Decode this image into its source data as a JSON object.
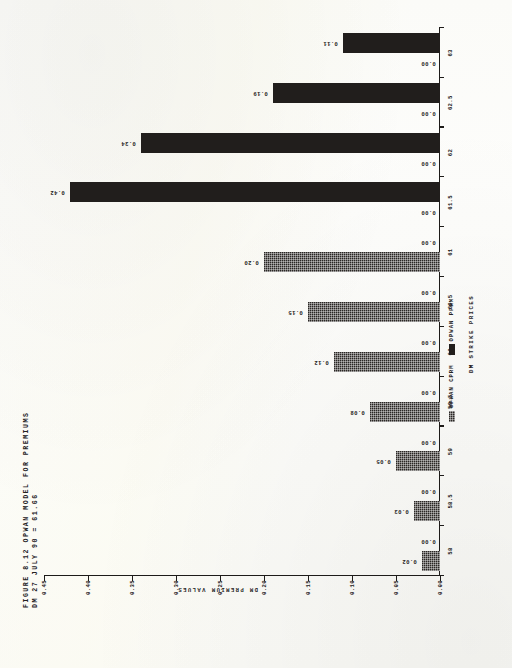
{
  "figure": {
    "title_line1": "FIGURE 8.12  OPWAN MODEL FOR PREMIUMS",
    "title_line2": "DM 27 JULY 90 = 61.66",
    "ylabel": "DM PREMIUM VALUES",
    "xlabel": "DM STRIKE PRICES"
  },
  "legend": {
    "cprm_label": "OPWAN CPRM",
    "pfrm_label": "OPWAN PFRM"
  },
  "chart_data": {
    "type": "bar",
    "title": "FIGURE 8.12  OPWAN MODEL FOR PREMIUMS  DM 27 JULY 90 = 61.66",
    "xlabel": "DM STRIKE PRICES",
    "ylabel": "DM PREMIUM VALUES",
    "categories": [
      "58",
      "58.5",
      "59",
      "59.5",
      "60",
      "60.5",
      "61",
      "61.5",
      "62",
      "62.5",
      "63"
    ],
    "ylim": [
      0.0,
      0.45
    ],
    "yticks": [
      "0.00",
      "0.05",
      "0.10",
      "0.15",
      "0.20",
      "0.25",
      "0.30",
      "0.35",
      "0.40",
      "0.45"
    ],
    "ytick_values": [
      0.0,
      0.05,
      0.1,
      0.15,
      0.2,
      0.25,
      0.3,
      0.35,
      0.4,
      0.45
    ],
    "grid": false,
    "legend_position": "bottom-center",
    "series": [
      {
        "name": "OPWAN CPRM",
        "values": [
          0.02,
          0.03,
          0.05,
          0.08,
          0.12,
          0.15,
          0.2,
          0.0,
          0.0,
          0.0,
          0.0
        ],
        "labels": [
          "0.02",
          "0.03",
          "0.05",
          "0.08",
          "0.12",
          "0.15",
          "0.20",
          "0.00",
          "0.00",
          "0.00",
          "0.00"
        ]
      },
      {
        "name": "OPWAN PFRM",
        "values": [
          0.0,
          0.0,
          0.0,
          0.0,
          0.0,
          0.0,
          0.0,
          0.42,
          0.34,
          0.19,
          0.11
        ],
        "labels": [
          "0.00",
          "0.00",
          "0.00",
          "0.00",
          "0.00",
          "0.00",
          "0.00",
          "0.42",
          "0.34",
          "0.19",
          "0.11"
        ]
      }
    ]
  }
}
